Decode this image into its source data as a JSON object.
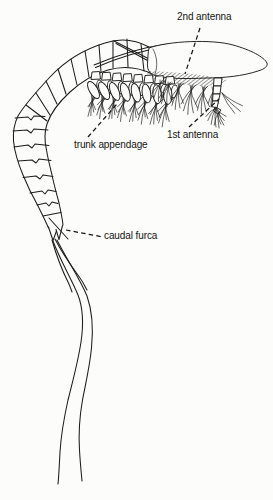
{
  "figure": {
    "type": "scientific-line-drawing",
    "background_color": "#fcfcfa",
    "ink_color": "#1c1c1c",
    "labels": {
      "second_antenna": "2nd antenna",
      "first_antenna": "1st antenna",
      "trunk_appendage": "trunk appendage",
      "caudal_furca": "caudal furca"
    }
  }
}
